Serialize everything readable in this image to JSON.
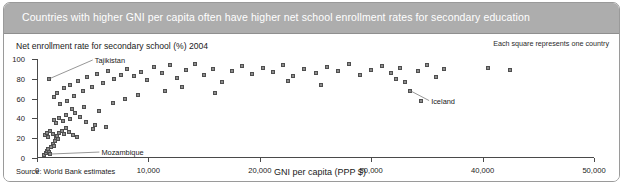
{
  "header": {
    "title": "Countries with higher GNI per capita often have higher net school enrollment rates for secondary education"
  },
  "notes": {
    "legend": "Each square represents one country",
    "source": "Source: World Bank estimates"
  },
  "chart_data": {
    "type": "scatter",
    "title": "Countries with higher GNI per capita often have higher net school enrollment rates for secondary education",
    "xlabel": "GNI per capita (PPP $)",
    "ylabel": "Net enrollment rate for secondary school (%) 2004",
    "xlim": [
      0,
      50000
    ],
    "ylim": [
      0,
      100
    ],
    "xticks": [
      0,
      10000,
      20000,
      30000,
      40000,
      50000
    ],
    "xticklabels": [
      "0",
      "10,000",
      "20,000",
      "30,000",
      "40,000",
      "50,000"
    ],
    "yticks": [
      0,
      20,
      40,
      60,
      80,
      100
    ],
    "yticklabels": [
      "0",
      "20",
      "40",
      "60",
      "80",
      "100"
    ],
    "grid": false,
    "legend": "Each square represents one country",
    "marker": "square",
    "marker_color": "#8c8c8c",
    "marker_edge_color": "#4f4f4f",
    "annotations": [
      {
        "label": "Tajikistan",
        "x": 1100,
        "y": 80,
        "label_x": 5000,
        "label_y": 99
      },
      {
        "label": "Mozambique",
        "x": 1200,
        "y": 4,
        "label_x": 5600,
        "label_y": 6
      },
      {
        "label": "Iceland",
        "x": 33500,
        "y": 68,
        "label_x": 35200,
        "label_y": 58
      }
    ],
    "points": [
      {
        "x": 600,
        "y": 3
      },
      {
        "x": 800,
        "y": 5
      },
      {
        "x": 900,
        "y": 7
      },
      {
        "x": 1000,
        "y": 9
      },
      {
        "x": 1100,
        "y": 6
      },
      {
        "x": 1200,
        "y": 4
      },
      {
        "x": 1300,
        "y": 11
      },
      {
        "x": 1400,
        "y": 14
      },
      {
        "x": 1500,
        "y": 12
      },
      {
        "x": 1600,
        "y": 17
      },
      {
        "x": 1700,
        "y": 20
      },
      {
        "x": 1800,
        "y": 22
      },
      {
        "x": 1900,
        "y": 19
      },
      {
        "x": 2000,
        "y": 25
      },
      {
        "x": 2200,
        "y": 27
      },
      {
        "x": 2400,
        "y": 24
      },
      {
        "x": 2600,
        "y": 30
      },
      {
        "x": 2900,
        "y": 26
      },
      {
        "x": 3200,
        "y": 23
      },
      {
        "x": 3600,
        "y": 21
      },
      {
        "x": 700,
        "y": 23
      },
      {
        "x": 900,
        "y": 25
      },
      {
        "x": 1000,
        "y": 21
      },
      {
        "x": 1200,
        "y": 27
      },
      {
        "x": 1400,
        "y": 24
      },
      {
        "x": 1500,
        "y": 38
      },
      {
        "x": 1700,
        "y": 35
      },
      {
        "x": 2000,
        "y": 40
      },
      {
        "x": 2300,
        "y": 37
      },
      {
        "x": 2600,
        "y": 43
      },
      {
        "x": 3000,
        "y": 39
      },
      {
        "x": 3400,
        "y": 45
      },
      {
        "x": 3900,
        "y": 41
      },
      {
        "x": 4400,
        "y": 36
      },
      {
        "x": 5200,
        "y": 33
      },
      {
        "x": 1100,
        "y": 80
      },
      {
        "x": 1500,
        "y": 62
      },
      {
        "x": 1800,
        "y": 66
      },
      {
        "x": 2100,
        "y": 55
      },
      {
        "x": 2400,
        "y": 71
      },
      {
        "x": 2700,
        "y": 58
      },
      {
        "x": 3000,
        "y": 74
      },
      {
        "x": 3300,
        "y": 63
      },
      {
        "x": 3700,
        "y": 78
      },
      {
        "x": 4100,
        "y": 68
      },
      {
        "x": 4500,
        "y": 82
      },
      {
        "x": 4900,
        "y": 72
      },
      {
        "x": 5400,
        "y": 85
      },
      {
        "x": 5900,
        "y": 76
      },
      {
        "x": 6400,
        "y": 88
      },
      {
        "x": 6900,
        "y": 80
      },
      {
        "x": 7500,
        "y": 84
      },
      {
        "x": 8100,
        "y": 90
      },
      {
        "x": 8700,
        "y": 83
      },
      {
        "x": 9300,
        "y": 87
      },
      {
        "x": 9900,
        "y": 79
      },
      {
        "x": 3100,
        "y": 50
      },
      {
        "x": 4200,
        "y": 52
      },
      {
        "x": 5600,
        "y": 47
      },
      {
        "x": 6800,
        "y": 56
      },
      {
        "x": 7900,
        "y": 60
      },
      {
        "x": 9100,
        "y": 64
      },
      {
        "x": 5000,
        "y": 29
      },
      {
        "x": 6200,
        "y": 31
      },
      {
        "x": 10500,
        "y": 92
      },
      {
        "x": 11200,
        "y": 86
      },
      {
        "x": 11900,
        "y": 94
      },
      {
        "x": 12600,
        "y": 81
      },
      {
        "x": 13400,
        "y": 89
      },
      {
        "x": 14200,
        "y": 95
      },
      {
        "x": 15000,
        "y": 84
      },
      {
        "x": 15800,
        "y": 90
      },
      {
        "x": 16600,
        "y": 77
      },
      {
        "x": 17500,
        "y": 88
      },
      {
        "x": 18400,
        "y": 93
      },
      {
        "x": 19300,
        "y": 85
      },
      {
        "x": 11500,
        "y": 68
      },
      {
        "x": 13000,
        "y": 72
      },
      {
        "x": 16000,
        "y": 66
      },
      {
        "x": 20300,
        "y": 91
      },
      {
        "x": 21200,
        "y": 87
      },
      {
        "x": 22100,
        "y": 94
      },
      {
        "x": 23000,
        "y": 83
      },
      {
        "x": 24000,
        "y": 90
      },
      {
        "x": 25000,
        "y": 86
      },
      {
        "x": 26000,
        "y": 92
      },
      {
        "x": 27000,
        "y": 88
      },
      {
        "x": 28000,
        "y": 95
      },
      {
        "x": 29000,
        "y": 84
      },
      {
        "x": 22500,
        "y": 78
      },
      {
        "x": 25500,
        "y": 74
      },
      {
        "x": 30000,
        "y": 89
      },
      {
        "x": 31000,
        "y": 93
      },
      {
        "x": 31800,
        "y": 86
      },
      {
        "x": 32600,
        "y": 91
      },
      {
        "x": 33500,
        "y": 68
      },
      {
        "x": 34200,
        "y": 88
      },
      {
        "x": 35000,
        "y": 94
      },
      {
        "x": 35800,
        "y": 82
      },
      {
        "x": 36500,
        "y": 90
      },
      {
        "x": 33000,
        "y": 77
      },
      {
        "x": 34500,
        "y": 58
      },
      {
        "x": 32200,
        "y": 80
      },
      {
        "x": 40500,
        "y": 91
      },
      {
        "x": 42500,
        "y": 89
      }
    ]
  }
}
